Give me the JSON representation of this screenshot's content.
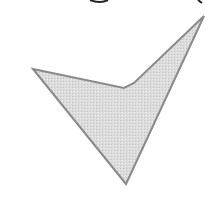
{
  "figure": {
    "shape": "concave-arrowhead-quadrilateral",
    "vertices": [
      [
        33,
        69
      ],
      [
        124,
        88
      ],
      [
        134,
        83
      ],
      [
        204,
        16
      ],
      [
        126,
        184
      ]
    ],
    "fill_color": "#d9d9d9",
    "stroke_color": "#8a8a8a",
    "stroke_width": 2
  },
  "top_fragments": {
    "note": "cut-off glyph descenders at top edge, unreadable",
    "left_x": 95,
    "right_x": 200
  }
}
